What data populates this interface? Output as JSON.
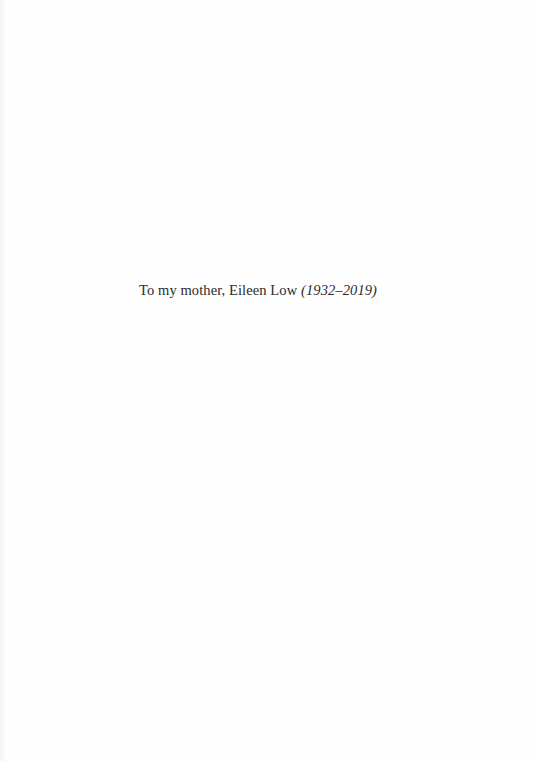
{
  "dedication": {
    "text": "To my mother, Eileen Low",
    "dates": "(1932–2019)"
  }
}
